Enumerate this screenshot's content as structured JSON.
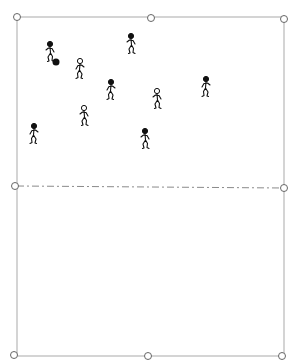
{
  "diagram": {
    "type": "sports-drill-field",
    "colors": {
      "boundary": "#d4d4d4",
      "midline": "#8a8a8a",
      "marker": "#666666",
      "player": "#111111"
    },
    "boundary": {
      "x1": 17,
      "y1": 17,
      "x2": 284,
      "y2": 356
    },
    "midline": {
      "x1": 17,
      "y1": 186,
      "x2": 284,
      "y2": 188,
      "style": "dash-dot"
    },
    "markers": [
      {
        "name": "corner-top-left",
        "x": 17,
        "y": 17
      },
      {
        "name": "top-center",
        "x": 151,
        "y": 18
      },
      {
        "name": "corner-top-right",
        "x": 284,
        "y": 19
      },
      {
        "name": "midline-left",
        "x": 15,
        "y": 186
      },
      {
        "name": "midline-right",
        "x": 284,
        "y": 188
      },
      {
        "name": "corner-bottom-left",
        "x": 14,
        "y": 355
      },
      {
        "name": "bottom-center",
        "x": 148,
        "y": 356
      },
      {
        "name": "corner-bottom-right",
        "x": 282,
        "y": 356
      }
    ],
    "players": [
      {
        "id": "p1",
        "team": "filled",
        "x": 50,
        "y": 44,
        "has_ball": true
      },
      {
        "id": "p2",
        "team": "hollow",
        "x": 80,
        "y": 61,
        "has_ball": false
      },
      {
        "id": "p3",
        "team": "filled",
        "x": 131,
        "y": 36,
        "has_ball": false
      },
      {
        "id": "p4",
        "team": "filled",
        "x": 111,
        "y": 82,
        "has_ball": false
      },
      {
        "id": "p5",
        "team": "hollow",
        "x": 157,
        "y": 91,
        "has_ball": false
      },
      {
        "id": "p6",
        "team": "filled",
        "x": 206,
        "y": 79,
        "has_ball": false
      },
      {
        "id": "p7",
        "team": "hollow",
        "x": 84,
        "y": 108,
        "has_ball": false
      },
      {
        "id": "p8",
        "team": "filled",
        "x": 34,
        "y": 126,
        "has_ball": false
      },
      {
        "id": "p9",
        "team": "filled",
        "x": 145,
        "y": 131,
        "has_ball": false
      }
    ],
    "ball": {
      "x": 56,
      "y": 62
    }
  }
}
